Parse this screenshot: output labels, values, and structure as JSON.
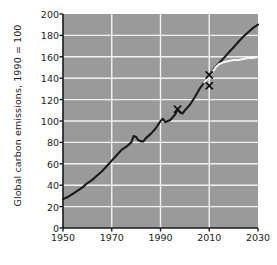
{
  "chart_data": {
    "type": "line",
    "title": "",
    "xlabel": "",
    "ylabel": "Global carbon emissions, 1990 = 100",
    "xlim": [
      1950,
      2030
    ],
    "ylim": [
      0,
      200
    ],
    "xticks": [
      1950,
      1970,
      1990,
      2010,
      2030
    ],
    "yticks": [
      0,
      20,
      40,
      60,
      80,
      100,
      120,
      140,
      160,
      180,
      200
    ],
    "grid": true,
    "legend": "none",
    "plot_bgcolor": "#9a9a9a",
    "grid_color": "#f2f2f2",
    "series": [
      {
        "name": "Global carbon emissions (actual and projected)",
        "color": "#1a1a1a",
        "x": [
          1950,
          1952,
          1954,
          1956,
          1958,
          1960,
          1962,
          1964,
          1966,
          1968,
          1970,
          1972,
          1974,
          1976,
          1978,
          1979,
          1980,
          1981,
          1982,
          1983,
          1984,
          1986,
          1988,
          1990,
          1991,
          1992,
          1993,
          1994,
          1996,
          1997,
          1998,
          1999,
          2000,
          2002,
          2004,
          2006,
          2008,
          2010,
          2012,
          2014,
          2016,
          2018,
          2020,
          2022,
          2024,
          2026,
          2028,
          2030
        ],
        "y": [
          27,
          29,
          32,
          35,
          38,
          42,
          45,
          49,
          53,
          58,
          63,
          68,
          73,
          76,
          80,
          86,
          85,
          82,
          81,
          81,
          84,
          88,
          93,
          100,
          102,
          99,
          100,
          101,
          106,
          111,
          108,
          107,
          110,
          115,
          122,
          130,
          136,
          143,
          149,
          154,
          159,
          164,
          169,
          174,
          179,
          183,
          187,
          190
        ]
      },
      {
        "name": "Alternative lower projection",
        "color": "#f4f4f4",
        "x": [
          2008,
          2009,
          2010,
          2011,
          2012,
          2013,
          2014,
          2016,
          2018,
          2020,
          2022,
          2024,
          2026,
          2028,
          2030
        ],
        "y": [
          136,
          139,
          142,
          145,
          148,
          151,
          153,
          155,
          156,
          157,
          157,
          158,
          159,
          159,
          160
        ]
      }
    ],
    "markers": [
      {
        "label": "marker-1997",
        "x": 1997,
        "y": 111,
        "symbol": "x",
        "color": "#111111"
      },
      {
        "label": "marker-2010-on-line",
        "x": 2010,
        "y": 143,
        "symbol": "x",
        "color": "#111111"
      },
      {
        "label": "marker-2010-below",
        "x": 2010,
        "y": 133,
        "symbol": "x",
        "color": "#111111"
      }
    ]
  }
}
